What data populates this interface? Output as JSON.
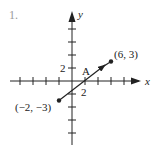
{
  "problem": {
    "number": "1."
  },
  "diagram": {
    "axes": {
      "x_label": "x",
      "y_label": "y",
      "tick_step": 2,
      "tick_label_x": "2",
      "tick_label_y": "2"
    },
    "vector": {
      "start": {
        "x": -2,
        "y": -3,
        "label": "(−2, −3)"
      },
      "end": {
        "x": 6,
        "y": 3,
        "label": "(6, 3)"
      },
      "midpoint": {
        "x": 2,
        "y": 0,
        "label": "A"
      }
    },
    "colors": {
      "ink": "#222222",
      "problem_number": "#9a9a9a"
    }
  }
}
